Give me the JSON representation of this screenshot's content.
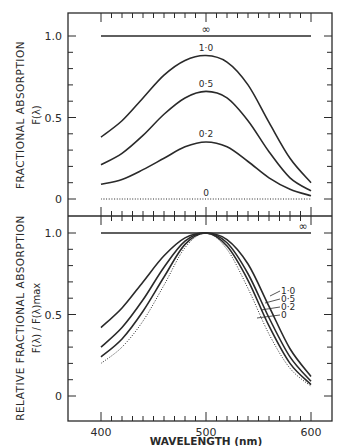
{
  "chart_data": [
    {
      "type": "line",
      "panel": "top",
      "title": "",
      "xlabel": "WAVELENGTH (nm)",
      "ylabel": "FRACTIONAL ABSORPTION",
      "ylabel_sub": "F(λ)",
      "xlim": [
        400,
        600
      ],
      "ylim": [
        0,
        1.0
      ],
      "y_ticks": [
        "0",
        "0.5",
        "1.0"
      ],
      "grid": false,
      "x": [
        400,
        420,
        440,
        460,
        480,
        500,
        520,
        540,
        560,
        580,
        600
      ],
      "series": [
        {
          "name": "∞",
          "style": "solid",
          "values": [
            1.0,
            1.0,
            1.0,
            1.0,
            1.0,
            1.0,
            1.0,
            1.0,
            1.0,
            1.0,
            1.0
          ]
        },
        {
          "name": "1·0",
          "style": "solid",
          "values": [
            0.38,
            0.48,
            0.62,
            0.76,
            0.85,
            0.88,
            0.84,
            0.7,
            0.47,
            0.25,
            0.1
          ]
        },
        {
          "name": "0·5",
          "style": "solid",
          "values": [
            0.21,
            0.28,
            0.39,
            0.52,
            0.62,
            0.66,
            0.62,
            0.48,
            0.29,
            0.13,
            0.05
          ]
        },
        {
          "name": "0·2",
          "style": "solid",
          "values": [
            0.09,
            0.12,
            0.18,
            0.25,
            0.32,
            0.35,
            0.32,
            0.23,
            0.13,
            0.06,
            0.02
          ]
        },
        {
          "name": "0",
          "style": "dotted",
          "values": [
            0,
            0,
            0,
            0,
            0,
            0,
            0,
            0,
            0,
            0,
            0
          ]
        }
      ]
    },
    {
      "type": "line",
      "panel": "bottom",
      "title": "",
      "xlabel": "WAVELENGTH (nm)",
      "ylabel": "RELATIVE FRACTIONAL ABSORPTION",
      "ylabel_sub": "F(λ) / F(λ)max",
      "xlim": [
        400,
        600
      ],
      "ylim": [
        0,
        1.0
      ],
      "x_ticks": [
        "400",
        "500",
        "600"
      ],
      "y_ticks": [
        "0",
        "0.5",
        "1.0"
      ],
      "grid": false,
      "x": [
        400,
        420,
        440,
        460,
        480,
        500,
        520,
        540,
        560,
        580,
        600
      ],
      "series": [
        {
          "name": "∞",
          "style": "solid",
          "values": [
            1.0,
            1.0,
            1.0,
            1.0,
            1.0,
            1.0,
            1.0,
            1.0,
            1.0,
            1.0,
            1.0
          ]
        },
        {
          "name": "1·0",
          "style": "solid",
          "values": [
            0.42,
            0.54,
            0.7,
            0.86,
            0.97,
            1.0,
            0.96,
            0.81,
            0.55,
            0.29,
            0.12
          ]
        },
        {
          "name": "0·5",
          "style": "solid",
          "values": [
            0.3,
            0.42,
            0.59,
            0.79,
            0.95,
            1.0,
            0.94,
            0.75,
            0.48,
            0.24,
            0.09
          ]
        },
        {
          "name": "0·2",
          "style": "solid",
          "values": [
            0.24,
            0.35,
            0.52,
            0.73,
            0.93,
            1.0,
            0.92,
            0.71,
            0.43,
            0.2,
            0.07
          ]
        },
        {
          "name": "0",
          "style": "dotted",
          "values": [
            0.2,
            0.3,
            0.46,
            0.68,
            0.91,
            1.0,
            0.9,
            0.66,
            0.38,
            0.17,
            0.06
          ]
        }
      ]
    }
  ],
  "labels": {
    "top_ylabel_main": "FRACTIONAL ABSORPTION",
    "top_ylabel_sub": "F(λ)",
    "bottom_ylabel_main": "RELATIVE FRACTIONAL ABSORPTION",
    "bottom_ylabel_sub": "F(λ) / F(λ)max",
    "xlabel": "WAVELENGTH (nm)",
    "x_ticks": [
      "400",
      "500",
      "600"
    ],
    "y_ticks": [
      "0",
      "0.5",
      "1.0"
    ],
    "top_curve_labels": [
      "∞",
      "1·0",
      "0·5",
      "0·2",
      "0"
    ],
    "bottom_curve_labels": [
      "∞",
      "1·0",
      "0·5",
      "0·2",
      "0"
    ]
  },
  "colors": {
    "ink": "#2a2a2a",
    "background": "#ffffff"
  }
}
